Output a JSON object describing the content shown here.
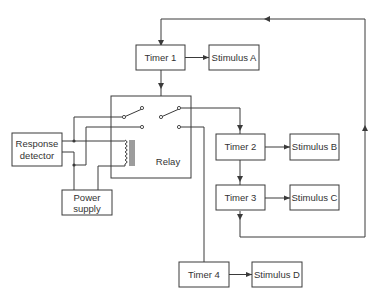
{
  "diagram": {
    "type": "block-diagram",
    "blocks": {
      "timer1": "Timer 1",
      "timer2": "Timer 2",
      "timer3": "Timer 3",
      "timer4": "Timer 4",
      "stimulusA": "Stimulus A",
      "stimulusB": "Stimulus B",
      "stimulusC": "Stimulus C",
      "stimulusD": "Stimulus D",
      "relay": "Relay",
      "response_detector_line1": "Response",
      "response_detector_line2": "detector",
      "power_supply_line1": "Power",
      "power_supply_line2": "supply"
    },
    "connections": [
      {
        "from": "Timer 1",
        "to": "Stimulus A"
      },
      {
        "from": "Timer 1",
        "to": "Relay"
      },
      {
        "from": "Relay",
        "to": "Timer 2"
      },
      {
        "from": "Relay",
        "to": "Timer 4"
      },
      {
        "from": "Timer 2",
        "to": "Stimulus B"
      },
      {
        "from": "Timer 2",
        "to": "Timer 3"
      },
      {
        "from": "Timer 3",
        "to": "Stimulus C"
      },
      {
        "from": "Timer 3",
        "to": "Timer 1"
      },
      {
        "from": "Timer 4",
        "to": "Stimulus D"
      },
      {
        "from": "Response detector",
        "to": "Relay"
      },
      {
        "from": "Power supply",
        "to": "Relay"
      }
    ]
  }
}
